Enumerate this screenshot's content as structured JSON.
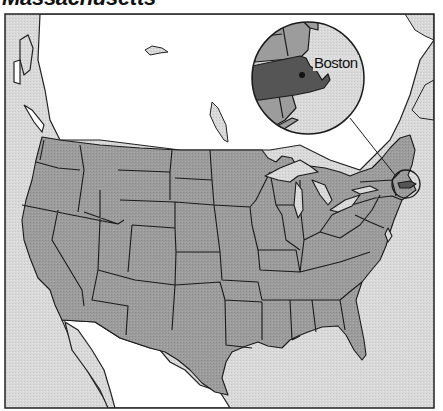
{
  "title": "Massachusetts",
  "map": {
    "subject": "United States (contiguous) with Massachusetts highlighted",
    "highlighted_state": "Massachusetts",
    "inset": {
      "label": "Boston",
      "description": "Magnified view of New England showing Massachusetts and Boston"
    },
    "colors": {
      "ocean": "#d6d6d6",
      "foreign_land": "#ffffff",
      "us_states": "#9b9b9b",
      "highlight": "#555555",
      "borders": "#222222"
    }
  }
}
